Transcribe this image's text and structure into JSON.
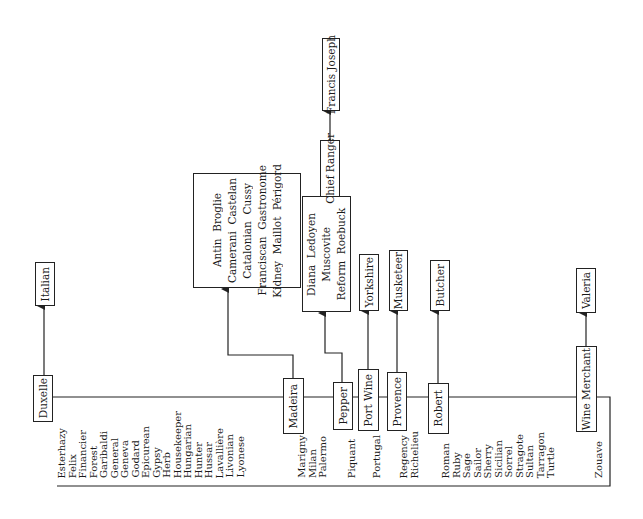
{
  "diagram": {
    "type": "sauce family tree (rotated 90°)",
    "root_line_items": {
      "group1": [
        "Esterhazy",
        "Felix",
        "Financier",
        "Forest",
        "Garibaldi",
        "General",
        "Geneva",
        "Godard",
        "Epicurean",
        "Gypsy",
        "Herb",
        "Housekeeper",
        "Hungarian",
        "Hunter",
        "Hussar",
        "Lavallière",
        "Livonian",
        "Lyonese"
      ],
      "group2": [
        "Marigny",
        "Milan",
        "Palermo"
      ],
      "group3": [
        "Piquant"
      ],
      "group4": [
        "Portugal"
      ],
      "group5": [
        "Regency",
        "Richelieu"
      ],
      "group6": [
        "Roman",
        "Ruby",
        "Sage",
        "Sailor",
        "Sherry",
        "Sicilian",
        "Sorrel",
        "Stragote",
        "Sultan",
        "Tarragon",
        "Turtle"
      ],
      "group7": [
        "Zouave"
      ]
    },
    "nodes": {
      "duxelle": "Duxelle",
      "italian": "Italian",
      "madeira": "Madeira",
      "madeira_children": [
        "Antin  Broglie",
        "Camerani  Castelan",
        "Catalonian  Cussy",
        "Franciscan  Gastronome",
        "Kidney  Maillot  Périgord"
      ],
      "pepper": "Pepper",
      "pepper_children": [
        "Diana  Ledoyen",
        "Muscovite",
        "Reform  Roebuck"
      ],
      "chief_ranger": "Chief Ranger",
      "francis_joseph": "Francis Joseph",
      "port_wine": "Port Wine",
      "yorkshire": "Yorkshire",
      "provence": "Provence",
      "musketeer": "Musketeer",
      "robert": "Robert",
      "butcher": "Butcher",
      "wine_merchant": "Wine Merchant",
      "valeria": "Valeria"
    },
    "colors": {
      "line": "#222222",
      "background": "#ffffff",
      "text": "#1a1a1a"
    }
  }
}
